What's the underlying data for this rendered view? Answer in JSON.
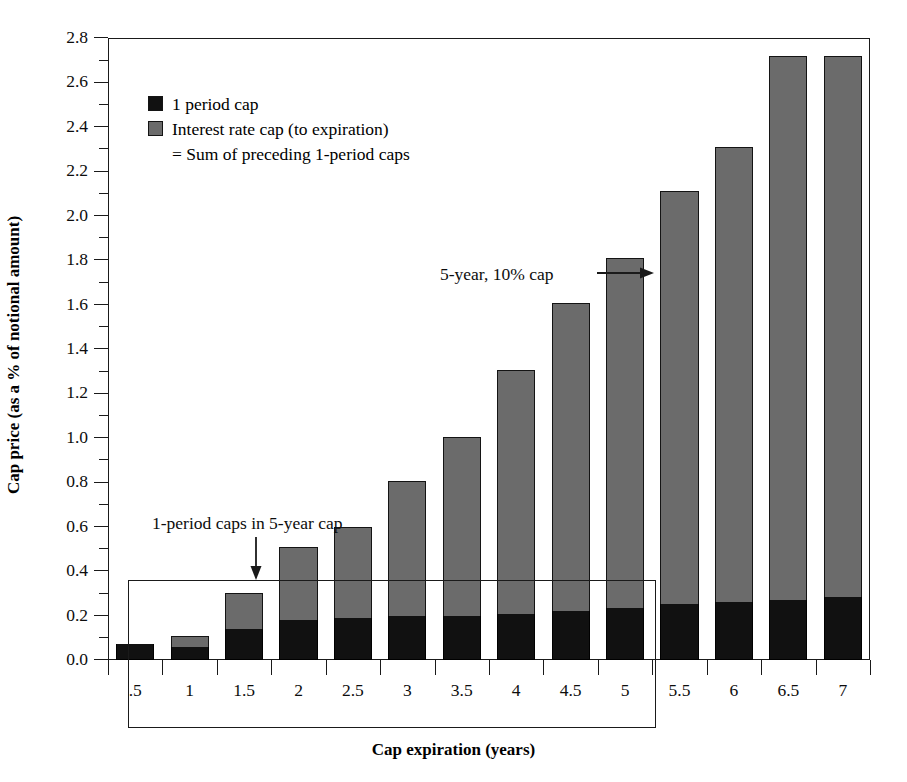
{
  "chart_data": {
    "type": "bar",
    "stacked": true,
    "title": "",
    "xlabel": "Cap expiration (years)",
    "ylabel": "Cap price (as a % of notional amount)",
    "categories": [
      ".5",
      "1",
      "1.5",
      "2",
      "2.5",
      "3",
      "3.5",
      "4",
      "4.5",
      "5",
      "5.5",
      "6",
      "6.5",
      "7"
    ],
    "ylim": [
      0.0,
      2.8
    ],
    "y_tick_step": 0.2,
    "y_minor_tick_step": 0.1,
    "y_ticks": [
      "0.0",
      "0.2",
      "0.4",
      "0.6",
      "0.8",
      "1.0",
      "1.2",
      "1.4",
      "1.6",
      "1.8",
      "2.0",
      "2.2",
      "2.4",
      "2.6",
      "2.8"
    ],
    "grid": false,
    "legend_position": "upper-left",
    "series": [
      {
        "name": "1 period cap",
        "color": "#111111",
        "values": [
          0.07,
          0.06,
          0.14,
          0.18,
          0.19,
          0.2,
          0.2,
          0.205,
          0.22,
          0.235,
          0.25,
          0.26,
          0.27,
          0.285
        ]
      },
      {
        "name": "Interest rate cap (to expiration)",
        "color": "#6b6b6b",
        "cumulative_totals": [
          0.07,
          0.11,
          0.3,
          0.51,
          0.6,
          0.805,
          1.005,
          1.305,
          1.605,
          1.81,
          2.11,
          2.31,
          2.72,
          2.72
        ]
      }
    ],
    "bar_totals": [
      0.07,
      0.11,
      0.3,
      0.51,
      0.6,
      0.805,
      1.005,
      1.305,
      1.605,
      1.81,
      2.11,
      2.31,
      2.72
    ],
    "bars": [
      {
        "category": ".5",
        "total": 0.07,
        "black": 0.07
      },
      {
        "category": "1",
        "total": 0.11,
        "black": 0.06
      },
      {
        "category": "1.5",
        "total": 0.3,
        "black": 0.14
      },
      {
        "category": "2",
        "total": 0.51,
        "black": 0.18
      },
      {
        "category": "2.5",
        "total": 0.6,
        "black": 0.19
      },
      {
        "category": "3",
        "total": 0.805,
        "black": 0.2
      },
      {
        "category": "3.5",
        "total": 1.005,
        "black": 0.2
      },
      {
        "category": "4",
        "total": 1.305,
        "black": 0.205
      },
      {
        "category": "4.5",
        "total": 1.605,
        "black": 0.22
      },
      {
        "category": "5",
        "total": 1.81,
        "black": 0.235
      },
      {
        "category": "5.5",
        "total": 2.11,
        "black": 0.25
      },
      {
        "category": "6",
        "total": 2.31,
        "black": 0.26
      },
      {
        "category": "6.5",
        "total": 2.72,
        "black": 0.27
      },
      {
        "category": "7",
        "total": 2.72,
        "black": 0.285
      }
    ],
    "annotations": [
      {
        "text": "1-period caps in 5-year cap",
        "arrow": "down"
      },
      {
        "text": "5-year, 10% cap",
        "arrow": "right"
      }
    ]
  },
  "legend": {
    "item1": "1 period cap",
    "item2": "Interest rate cap (to expiration)",
    "item2_cont": "= Sum of preceding 1-period caps"
  },
  "axes": {
    "y_title": "Cap price (as a % of notional amount)",
    "x_title": "Cap expiration (years)"
  },
  "annotations": {
    "left": "1-period caps in 5-year cap",
    "right": "5-year, 10% cap"
  }
}
